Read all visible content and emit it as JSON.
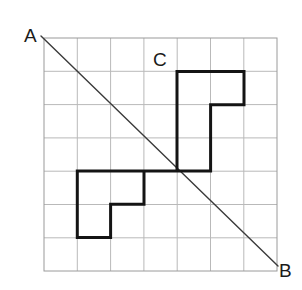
{
  "figure": {
    "background_color": "#ffffff",
    "labels": {
      "a": "A",
      "b": "B",
      "c": "C"
    },
    "grid": {
      "name": "square-grid",
      "origin_x": 44,
      "origin_y": 38,
      "cell_size": 33.3,
      "columns": 7,
      "rows": 7,
      "width": 233,
      "height": 233,
      "line_color": "#b9b9b9",
      "line_width": 1,
      "border_color": "#9a9a9a",
      "border_width": 1
    },
    "diagonal": {
      "name": "line-ab",
      "from_label": "A",
      "to_label": "B",
      "x1": 41,
      "y1": 36,
      "x2": 278,
      "y2": 266,
      "color": "#3a3a3a",
      "width": 1.4
    },
    "polygon": {
      "name": "symmetric-polygon",
      "stroke_color": "#141414",
      "stroke_width": 3,
      "fill": "none",
      "center_x": 177,
      "center_y": 171,
      "points": "177,171 177,71.4 244,71.4 244,104.7 210.6,104.7 210.6,171 144,171 144,204.3 110.6,204.3 110.6,237.6 77.3,237.6 77.3,171 177,171",
      "vertices": [
        [
          177,
          171
        ],
        [
          177,
          71.4
        ],
        [
          244,
          71.4
        ],
        [
          244,
          104.7
        ],
        [
          210.6,
          104.7
        ],
        [
          210.6,
          171
        ],
        [
          144,
          171
        ],
        [
          144,
          204.3
        ],
        [
          110.6,
          204.3
        ],
        [
          110.6,
          237.6
        ],
        [
          77.3,
          237.6
        ],
        [
          77.3,
          171
        ],
        [
          177,
          171
        ]
      ]
    }
  }
}
